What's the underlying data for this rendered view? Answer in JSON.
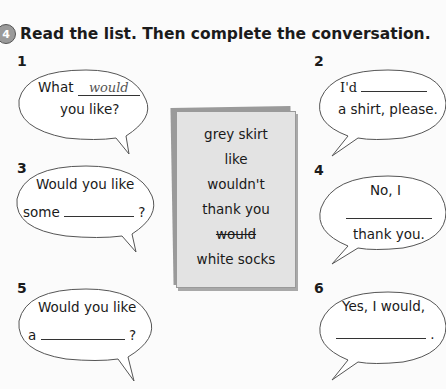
{
  "exercise": {
    "number": "4",
    "instruction": "Read the list. Then complete the conversation."
  },
  "word_list": [
    "grey skirt",
    "like",
    "wouldn't",
    "thank you",
    "would",
    "white socks"
  ],
  "word_list_crossed": [
    false,
    false,
    false,
    false,
    true,
    false
  ],
  "bubbles": [
    {
      "num": "1",
      "line1_prefix": "What",
      "answer": "would",
      "line2": "you like?"
    },
    {
      "num": "2",
      "line1_prefix": "I'd",
      "line2": "a shirt, please."
    },
    {
      "num": "3",
      "line1": "Would you like",
      "line2_prefix": "some",
      "line2_suffix": "?"
    },
    {
      "num": "4",
      "line1": "No, I",
      "line3": "thank you."
    },
    {
      "num": "5",
      "line1": "Would you like",
      "line2_prefix": "a",
      "line2_suffix": "?"
    },
    {
      "num": "6",
      "line1": "Yes, I would,",
      "line2_suffix": "."
    }
  ]
}
